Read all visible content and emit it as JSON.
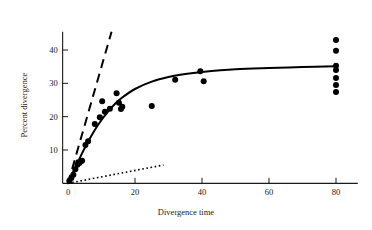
{
  "chart_data": {
    "type": "scatter",
    "title": "",
    "subtitle": "",
    "xlabel": "Divergence time",
    "ylabel": "Percent divergence",
    "xlim": [
      -2,
      88
    ],
    "ylim": [
      0,
      46
    ],
    "xticks": [
      0,
      20,
      40,
      60,
      80
    ],
    "xtick_labels": [
      "0",
      "20",
      "40",
      "60",
      "80"
    ],
    "yticks": [
      10,
      20,
      30,
      40
    ],
    "ytick_labels": [
      "10",
      "20",
      "30",
      "40"
    ],
    "grid": false,
    "legend": "none",
    "legend_position": "none",
    "colors": {
      "points": "#000000",
      "fitted_curve": "#000000",
      "dashed_line": "#000000",
      "dotted_line": "#000000",
      "axis": "#1a1a1a",
      "background": "#ffffff"
    },
    "series": [
      {
        "name": "observed points",
        "style": "scatter",
        "marker": "filled-circle",
        "points": [
          [
            0.4,
            0.7
          ],
          [
            1.0,
            1.6
          ],
          [
            1.6,
            2.6
          ],
          [
            2.2,
            4.2
          ],
          [
            2.8,
            5.6
          ],
          [
            3.1,
            6.3
          ],
          [
            3.4,
            6.1
          ],
          [
            3.8,
            6.6
          ],
          [
            4.2,
            6.8
          ],
          [
            5.2,
            11.5
          ],
          [
            6.0,
            12.6
          ],
          [
            8.0,
            17.8
          ],
          [
            9.5,
            19.8
          ],
          [
            10.2,
            24.6
          ],
          [
            11.0,
            21.5
          ],
          [
            12.5,
            22.4
          ],
          [
            14.5,
            27.0
          ],
          [
            15.2,
            24.2
          ],
          [
            15.8,
            22.3
          ],
          [
            16.2,
            23.0
          ],
          [
            25.0,
            23.2
          ],
          [
            32.0,
            31.1
          ],
          [
            39.5,
            33.6
          ],
          [
            40.5,
            30.6
          ],
          [
            80.0,
            43.0
          ],
          [
            80.0,
            39.8
          ],
          [
            80.0,
            35.3
          ],
          [
            80.0,
            34.0
          ],
          [
            80.0,
            31.6
          ],
          [
            80.0,
            29.5
          ],
          [
            80.0,
            27.4
          ]
        ]
      },
      {
        "name": "fitted saturating curve",
        "style": "solid-line",
        "points": [
          [
            0.0,
            0.0
          ],
          [
            1.0,
            2.2
          ],
          [
            2.0,
            4.4
          ],
          [
            3.0,
            6.5
          ],
          [
            4.0,
            8.6
          ],
          [
            5.0,
            10.6
          ],
          [
            6.0,
            12.5
          ],
          [
            8.0,
            16.0
          ],
          [
            10.0,
            19.0
          ],
          [
            12.0,
            21.6
          ],
          [
            14.0,
            23.8
          ],
          [
            16.0,
            25.6
          ],
          [
            20.0,
            28.3
          ],
          [
            25.0,
            30.5
          ],
          [
            30.0,
            31.9
          ],
          [
            35.0,
            32.8
          ],
          [
            40.0,
            33.4
          ],
          [
            50.0,
            34.2
          ],
          [
            60.0,
            34.6
          ],
          [
            70.0,
            34.9
          ],
          [
            80.0,
            35.1
          ]
        ]
      },
      {
        "name": "steep reference line",
        "style": "dashed-line",
        "points": [
          [
            0.0,
            0.0
          ],
          [
            13.0,
            45.5
          ]
        ]
      },
      {
        "name": "shallow reference line",
        "style": "dotted-line",
        "points": [
          [
            0.0,
            0.0
          ],
          [
            28.5,
            5.5
          ]
        ]
      }
    ]
  }
}
